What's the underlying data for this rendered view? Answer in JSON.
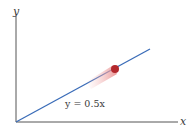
{
  "diagram": {
    "x_axis_label": "x",
    "y_axis_label": "y",
    "line_equation": "y = 0.5x",
    "line_slope": 0.5,
    "colors": {
      "axes": "#555555",
      "line": "#3a6cb8",
      "ball": "#b3282d",
      "motion_trail": "#f2a7a7"
    }
  }
}
